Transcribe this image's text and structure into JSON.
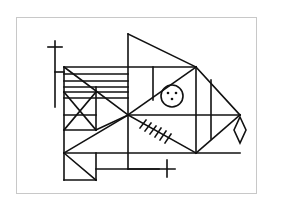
{
  "diagram": {
    "title": "",
    "stroke_color": "#111111",
    "frame_color": "#c8c8c8",
    "background": "#ffffff",
    "elements": [
      {
        "type": "cross",
        "name": "top-left-cross"
      },
      {
        "type": "rect-grid",
        "name": "left-striped-box"
      },
      {
        "type": "triangle",
        "name": "top-fin-triangle"
      },
      {
        "type": "circle",
        "name": "eye-circle",
        "dots": 3
      },
      {
        "type": "hatched-line",
        "name": "hatched-diagonal",
        "ticks": 6
      },
      {
        "type": "cross",
        "name": "bottom-cross"
      },
      {
        "type": "diamond",
        "name": "diamond-pendant"
      }
    ]
  }
}
